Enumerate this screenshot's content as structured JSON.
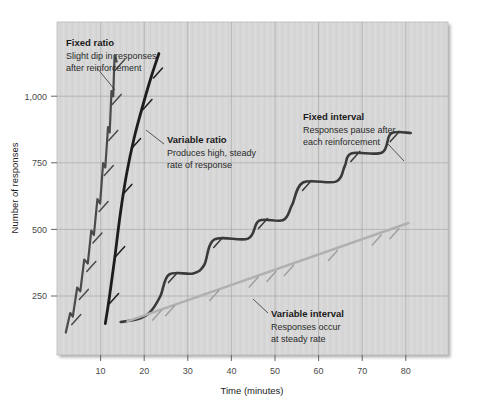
{
  "chart_data": {
    "type": "line",
    "title": "",
    "xlabel": "Time (minutes)",
    "ylabel": "Number of responses",
    "xlim": [
      0,
      89
    ],
    "ylim": [
      0,
      1110
    ],
    "xticks": [
      10,
      20,
      30,
      40,
      50,
      60,
      70,
      80
    ],
    "xticklabels": [
      "10",
      "20",
      "30",
      "40",
      "50",
      "60",
      "70",
      "80"
    ],
    "yticks": [
      250,
      500,
      750,
      1000
    ],
    "yticklabels": [
      "250",
      "500",
      "750",
      "1,000"
    ],
    "grid": true,
    "legend_position": "in-plot annotations",
    "plot_background": "#d6d6d6",
    "series": [
      {
        "name": "Fixed ratio",
        "color": "#4a4a4a",
        "style": "stepped steep rising with small post-reinforcement dips",
        "points": [
          [
            2.0,
            75
          ],
          [
            3.0,
            140
          ],
          [
            3.6,
            128
          ],
          [
            4.6,
            225
          ],
          [
            5.3,
            212
          ],
          [
            6.2,
            318
          ],
          [
            7.0,
            305
          ],
          [
            7.8,
            415
          ],
          [
            8.4,
            400
          ],
          [
            9.2,
            520
          ],
          [
            9.8,
            505
          ],
          [
            10.5,
            640
          ],
          [
            11.0,
            625
          ],
          [
            11.6,
            760
          ],
          [
            12.0,
            742
          ],
          [
            12.4,
            880
          ],
          [
            12.8,
            862
          ],
          [
            13.1,
            1000
          ],
          [
            13.6,
            978
          ]
        ]
      },
      {
        "name": "Variable ratio",
        "color": "#1d1d1d",
        "style": "smooth steep steady line",
        "points": [
          [
            11.0,
            105
          ],
          [
            12.0,
            200
          ],
          [
            13.2,
            330
          ],
          [
            14.4,
            470
          ],
          [
            15.8,
            600
          ],
          [
            17.5,
            720
          ],
          [
            19.5,
            830
          ],
          [
            21.5,
            930
          ],
          [
            23.2,
            1005
          ]
        ]
      },
      {
        "name": "Fixed interval",
        "color": "#3a3a3a",
        "style": "scalloped staircase with pauses after each reinforcement",
        "points": [
          [
            14.5,
            110
          ],
          [
            18.0,
            118
          ],
          [
            21.0,
            140
          ],
          [
            23.5,
            195
          ],
          [
            25.5,
            268
          ],
          [
            31.0,
            272
          ],
          [
            33.5,
            300
          ],
          [
            35.8,
            385
          ],
          [
            43.5,
            388
          ],
          [
            46.0,
            448
          ],
          [
            51.5,
            450
          ],
          [
            53.5,
            500
          ],
          [
            56.0,
            575
          ],
          [
            63.5,
            578
          ],
          [
            65.5,
            630
          ],
          [
            67.0,
            672
          ],
          [
            74.0,
            675
          ],
          [
            76.0,
            738
          ],
          [
            80.5,
            740
          ]
        ]
      },
      {
        "name": "Variable interval",
        "color": "#b0b0b0",
        "style": "straight shallow steady slope",
        "points": [
          [
            16.0,
            112
          ],
          [
            80.0,
            440
          ]
        ]
      }
    ],
    "annotations": [
      {
        "id": "fixed-ratio",
        "title": "Fixed ratio",
        "lines": [
          "Slight dip in responses",
          "after reinforcement"
        ],
        "x": 66,
        "y": 38,
        "leader": [
          [
            97,
            68
          ],
          [
            115,
            90
          ]
        ]
      },
      {
        "id": "variable-ratio",
        "title": "Variable ratio",
        "lines": [
          "Produces high, steady",
          "rate of response"
        ],
        "x": 167,
        "y": 135,
        "leader": [
          [
            164,
            144
          ],
          [
            148,
            131
          ]
        ]
      },
      {
        "id": "fixed-interval",
        "title": "Fixed interval",
        "lines": [
          "Responses pause after",
          "each reinforcement"
        ],
        "x": 303,
        "y": 112,
        "leader": [
          [
            388,
            144
          ],
          [
            403,
            160
          ]
        ]
      },
      {
        "id": "variable-interval",
        "title": "Variable interval",
        "lines": [
          "Responses occur",
          "at steady rate"
        ],
        "x": 271,
        "y": 310,
        "leader": [
          [
            268,
            316
          ],
          [
            253,
            300
          ]
        ]
      }
    ]
  }
}
